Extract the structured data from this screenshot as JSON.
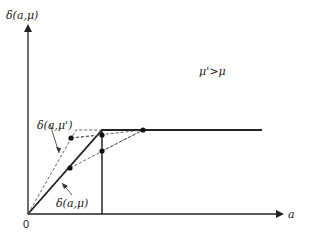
{
  "diagram": {
    "y_axis_label": "δ(a,μ)",
    "x_axis_label": "a",
    "origin_label": "0",
    "condition_label": "μ'>μ",
    "curve_labels": {
      "mu_prime": "δ(a,μ')",
      "mu": "δ(a,μ)"
    },
    "colors": {
      "line": "#222222",
      "dashed": "#555555",
      "background": "#ffffff"
    }
  }
}
